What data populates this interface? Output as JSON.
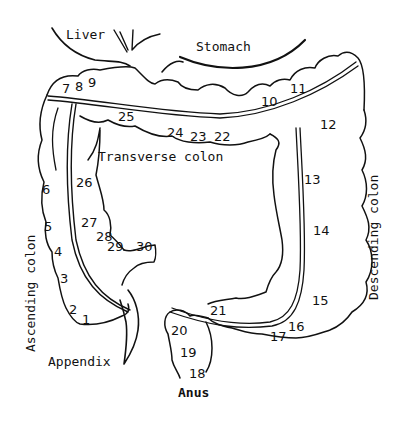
{
  "diagram": {
    "labels": {
      "liver": "Liver",
      "stomach": "Stomach",
      "transverse_colon": "Transverse colon",
      "ascending_colon": "Ascending colon",
      "descending_colon": "Descending colon",
      "appendix": "Appendix",
      "anus": "Anus"
    },
    "segment_numbers": [
      {
        "id": 1,
        "label": "1"
      },
      {
        "id": 2,
        "label": "2"
      },
      {
        "id": 3,
        "label": "3"
      },
      {
        "id": 4,
        "label": "4"
      },
      {
        "id": 5,
        "label": "5"
      },
      {
        "id": 6,
        "label": "6"
      },
      {
        "id": 7,
        "label": "7"
      },
      {
        "id": 8,
        "label": "8"
      },
      {
        "id": 9,
        "label": "9"
      },
      {
        "id": 10,
        "label": "10"
      },
      {
        "id": 11,
        "label": "11"
      },
      {
        "id": 12,
        "label": "12"
      },
      {
        "id": 13,
        "label": "13"
      },
      {
        "id": 14,
        "label": "14"
      },
      {
        "id": 15,
        "label": "15"
      },
      {
        "id": 16,
        "label": "16"
      },
      {
        "id": 17,
        "label": "17"
      },
      {
        "id": 18,
        "label": "18"
      },
      {
        "id": 19,
        "label": "19"
      },
      {
        "id": 20,
        "label": "20"
      },
      {
        "id": 21,
        "label": "21"
      },
      {
        "id": 22,
        "label": "22"
      },
      {
        "id": 23,
        "label": "23"
      },
      {
        "id": 24,
        "label": "24"
      },
      {
        "id": 25,
        "label": "25"
      },
      {
        "id": 26,
        "label": "26"
      },
      {
        "id": 27,
        "label": "27"
      },
      {
        "id": 28,
        "label": "28"
      },
      {
        "id": 29,
        "label": "29"
      },
      {
        "id": 30,
        "label": "30"
      }
    ],
    "colors": {
      "ink": "#111111",
      "background": "#ffffff"
    }
  }
}
